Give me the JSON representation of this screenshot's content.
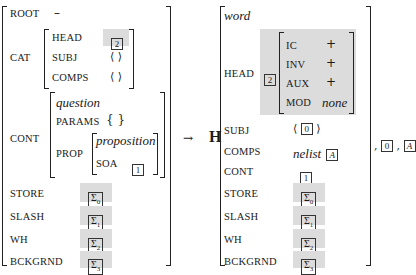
{
  "lhs": {
    "root": {
      "label": "ROOT",
      "value": "–"
    },
    "cat": {
      "label": "CAT",
      "head": {
        "label": "HEAD",
        "tag": "2"
      },
      "subj": {
        "label": "SUBJ",
        "value": "⟨ ⟩"
      },
      "comps": {
        "label": "COMPS",
        "value": "⟨ ⟩"
      }
    },
    "cont": {
      "label": "CONT",
      "type": "question",
      "params": {
        "label": "PARAMS",
        "value": "{ }"
      },
      "prop": {
        "label": "PROP",
        "type": "proposition",
        "soa": {
          "label": "SOA",
          "tag": "1"
        }
      }
    },
    "store": {
      "label": "STORE",
      "sigma": "Σ",
      "sub": "0"
    },
    "slash": {
      "label": "SLASH",
      "sigma": "Σ",
      "sub": "1"
    },
    "wh": {
      "label": "WH",
      "sigma": "Σ",
      "sub": "2"
    },
    "bckgrnd": {
      "label": "BCKGRND",
      "sigma": "Σ",
      "sub": "3"
    }
  },
  "arrow": "→",
  "head_daughter_label": "H",
  "rhs": {
    "type": "word",
    "head": {
      "label": "HEAD",
      "tag": "2",
      "features": [
        {
          "label": "IC",
          "value": "+"
        },
        {
          "label": "INV",
          "value": "+"
        },
        {
          "label": "AUX",
          "value": "+"
        },
        {
          "label": "MOD",
          "value": "none"
        }
      ]
    },
    "subj": {
      "label": "SUBJ",
      "open": "⟨",
      "tag": "0",
      "close": "⟩"
    },
    "comps": {
      "label": "COMPS",
      "type": "nelist",
      "tag": "A"
    },
    "cont": {
      "label": "CONT",
      "tag": "1"
    },
    "store": {
      "label": "STORE",
      "sigma": "Σ",
      "sub": "0"
    },
    "slash": {
      "label": "SLASH",
      "sigma": "Σ",
      "sub": "1"
    },
    "wh": {
      "label": "WH",
      "sigma": "Σ",
      "sub": "2"
    },
    "bckgrnd": {
      "label": "BCKGRND",
      "sigma": "Σ",
      "sub": "3"
    }
  },
  "trailing": {
    "sep1": ",",
    "tag0": "0",
    "sep2": ",",
    "tagA": "A"
  }
}
